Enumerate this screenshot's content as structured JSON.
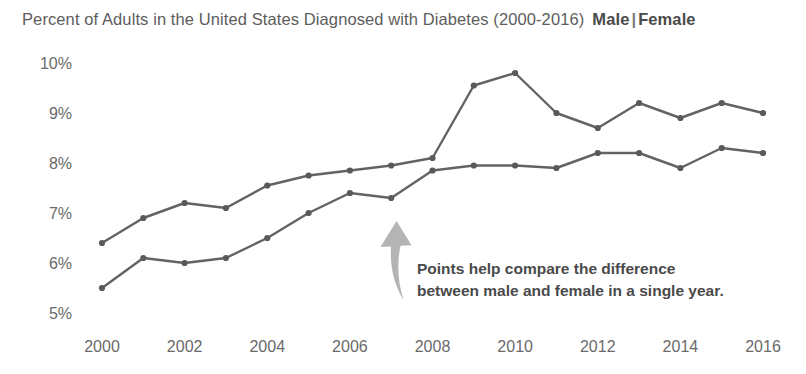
{
  "header": {
    "title": "Percent of Adults in the United States Diagnosed with Diabetes (2000-2016)",
    "legend_male": "Male",
    "legend_separator": "|",
    "legend_female": "Female"
  },
  "annotation": {
    "line1": "Points help compare the difference",
    "line2": "between male and female in a single year.",
    "arrow_icon": "curved-arrow-up-left-icon",
    "arrow_color": "#b4b4b4"
  },
  "colors": {
    "line": "#636363",
    "point": "#5a5a5a",
    "text": "#5d5d5d",
    "tick": "#6a6a6a"
  },
  "chart_data": {
    "type": "line",
    "title": "Percent of Adults in the United States Diagnosed with Diabetes (2000-2016)",
    "xlabel": "",
    "ylabel": "",
    "x": [
      2000,
      2001,
      2002,
      2003,
      2004,
      2005,
      2006,
      2007,
      2008,
      2009,
      2010,
      2011,
      2012,
      2013,
      2014,
      2015,
      2016
    ],
    "xtick_labels": [
      "2000",
      "2002",
      "2004",
      "2006",
      "2008",
      "2010",
      "2012",
      "2014",
      "2016"
    ],
    "xticks": [
      2000,
      2002,
      2004,
      2006,
      2008,
      2010,
      2012,
      2014,
      2016
    ],
    "ytick_labels": [
      "5%",
      "6%",
      "7%",
      "8%",
      "9%",
      "10%"
    ],
    "yticks": [
      5,
      6,
      7,
      8,
      9,
      10
    ],
    "ylim": [
      4.7,
      10.3
    ],
    "xlim": [
      1999.6,
      2016.4
    ],
    "grid": false,
    "legend_position": "title-right",
    "markers": true,
    "series": [
      {
        "name": "Female",
        "values": [
          6.4,
          6.9,
          7.2,
          7.1,
          7.55,
          7.75,
          7.85,
          7.95,
          8.1,
          9.55,
          9.8,
          9.0,
          8.7,
          9.2,
          8.9,
          9.2,
          9.0
        ]
      },
      {
        "name": "Male",
        "values": [
          5.5,
          6.1,
          6.0,
          6.1,
          6.5,
          7.0,
          7.4,
          7.3,
          7.85,
          7.95,
          7.95,
          7.9,
          8.2,
          8.2,
          7.9,
          8.3,
          8.2
        ]
      }
    ],
    "annotations": [
      {
        "text": "Points help compare the difference between male and female in a single year.",
        "arrow_target_x": 2007,
        "arrow_target_y": 7.3
      }
    ]
  }
}
